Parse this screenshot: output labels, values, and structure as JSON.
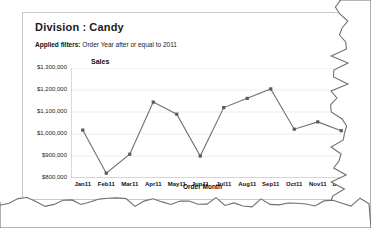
{
  "card": {
    "title_label": "Division",
    "title_separator": ":",
    "title_value": "Candy",
    "filter_label": "Applied filters:",
    "filter_value": "Order Year after or equal to 2011"
  },
  "colors": {
    "line": "#6e6e6e",
    "marker": "#5a5a5a",
    "axis": "#b4b4b4",
    "grid": "#ececec",
    "border": "#c9c9c9",
    "text": "#1a1a1a",
    "paper_tear": "#8a8a8a"
  },
  "chart_data": {
    "type": "line",
    "title": "",
    "xlabel": "Order Month",
    "ylabel": "Sales",
    "categories": [
      "Jan11",
      "Feb11",
      "Mar11",
      "Apr11",
      "May11",
      "Jun11",
      "Jul11",
      "Aug11",
      "Sep11",
      "Oct11",
      "Nov11",
      "Dec11"
    ],
    "values": [
      1018000,
      822000,
      908000,
      1145000,
      1090000,
      900000,
      1120000,
      1162000,
      1205000,
      1022000,
      1055000,
      1015000
    ],
    "ylim": [
      800000,
      1300000
    ],
    "ytick_values": [
      1300000,
      1200000,
      1100000,
      1000000,
      900000,
      800000
    ],
    "ytick_labels": [
      "$1,300,000",
      "$1,200,000",
      "$1,100,000",
      "$1,000,000",
      "$900,000",
      "$800,000"
    ],
    "grid": true,
    "legend": "none",
    "series": [
      {
        "name": "Sales",
        "values": [
          1018000,
          822000,
          908000,
          1145000,
          1090000,
          900000,
          1120000,
          1162000,
          1205000,
          1022000,
          1055000,
          1015000
        ]
      }
    ]
  }
}
